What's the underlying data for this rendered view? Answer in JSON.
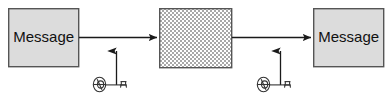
{
  "diagram": {
    "canvas": {
      "width": 392,
      "height": 101,
      "background": "#ffffff"
    },
    "colors": {
      "box_fill": "#dcdcdc",
      "box_stroke": "#555555",
      "cipher_light": "#ffffff",
      "cipher_dark": "#a8a8a8",
      "arrow": "#1a1a1a",
      "key_stroke": "#333333",
      "text": "#111111"
    },
    "nodes": [
      {
        "id": "plaintext-in",
        "kind": "box",
        "label": "Message",
        "style": "solid-gray",
        "x": 8,
        "y": 8,
        "width": 71,
        "height": 59
      },
      {
        "id": "ciphertext",
        "kind": "box",
        "label": "",
        "style": "checkerboard",
        "x": 159,
        "y": 8,
        "width": 73,
        "height": 60
      },
      {
        "id": "plaintext-out",
        "kind": "box",
        "label": "Message",
        "style": "solid-gray",
        "x": 313,
        "y": 8,
        "width": 71,
        "height": 59
      }
    ],
    "edges": [
      {
        "id": "edge-encrypt",
        "from": "plaintext-in",
        "to": "ciphertext",
        "orientation": "horizontal",
        "x1": 79,
        "y1": 37,
        "x2": 158,
        "y2": 37,
        "arrowhead": "end"
      },
      {
        "id": "edge-decrypt",
        "from": "ciphertext",
        "to": "plaintext-out",
        "orientation": "horizontal",
        "x1": 232,
        "y1": 37,
        "x2": 312,
        "y2": 37,
        "arrowhead": "end"
      },
      {
        "id": "edge-key-encrypt",
        "from": "key-encrypt",
        "to": "edge-encrypt",
        "orientation": "vertical",
        "x1": 116,
        "y1": 84,
        "x2": 116,
        "y2": 40,
        "arrowhead": "end"
      },
      {
        "id": "edge-key-decrypt",
        "from": "key-decrypt",
        "to": "edge-decrypt",
        "orientation": "vertical",
        "x1": 280,
        "y1": 84,
        "x2": 280,
        "y2": 40,
        "arrowhead": "end"
      }
    ],
    "keys": [
      {
        "id": "key-encrypt",
        "icon": "key-icon",
        "label": "",
        "x": 92,
        "y": 84
      },
      {
        "id": "key-decrypt",
        "icon": "key-icon",
        "label": "",
        "x": 256,
        "y": 84
      }
    ]
  }
}
